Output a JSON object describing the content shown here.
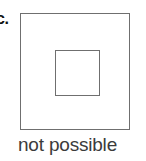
{
  "figure": {
    "option_label": "c.",
    "caption": "not possible",
    "shapes": {
      "outer_square": {
        "name": "outer-square",
        "stroke_color": "#6f6f6f",
        "fill_color": "#ffffff"
      },
      "inner_square": {
        "name": "inner-square",
        "stroke_color": "#6f6f6f",
        "fill_color": "#ffffff"
      }
    },
    "background_color": "#ffffff",
    "caption_color": "#3b3b3b",
    "label_color": "#101010"
  }
}
